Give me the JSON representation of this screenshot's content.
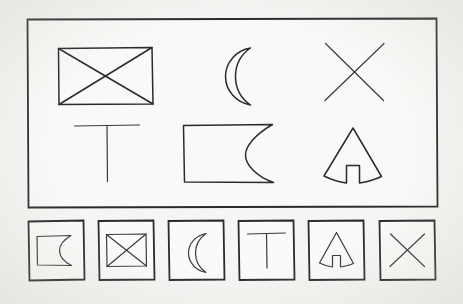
{
  "document": {
    "kind": "hand-drawn-shape-sheet",
    "background_color": "#f6f5f3",
    "ink_color": "#2b2b2b",
    "paper_color": "#faf9f7"
  },
  "main_panel": {
    "name": "main-shape-panel",
    "border_color": "#2b2b2b",
    "rows": [
      {
        "row_index": 1,
        "shapes": [
          {
            "id": "crossed-rectangle",
            "label": "crossed rectangle",
            "icon": "rectangle-with-x-icon"
          },
          {
            "id": "crescent-moon",
            "label": "crescent moon",
            "icon": "crescent-moon-icon"
          },
          {
            "id": "x-cross",
            "label": "x cross",
            "icon": "x-icon"
          }
        ]
      },
      {
        "row_index": 2,
        "shapes": [
          {
            "id": "tee",
            "label": "tee",
            "icon": "t-shape-icon"
          },
          {
            "id": "rectangle-concave-right",
            "label": "rectangle with concave right side",
            "icon": "rectangle-concave-icon"
          },
          {
            "id": "tent",
            "label": "tent with door",
            "icon": "tent-icon"
          }
        ]
      }
    ]
  },
  "thumbnail_strip": {
    "name": "thumbnail-strip",
    "count": 6,
    "boxes": [
      {
        "position": 1,
        "id": "rectangle-concave-right",
        "label": "rectangle with concave right side",
        "icon": "rectangle-concave-icon"
      },
      {
        "position": 2,
        "id": "crossed-rectangle",
        "label": "crossed rectangle",
        "icon": "rectangle-with-x-icon"
      },
      {
        "position": 3,
        "id": "crescent-moon",
        "label": "crescent moon",
        "icon": "crescent-moon-icon"
      },
      {
        "position": 4,
        "id": "tee",
        "label": "tee",
        "icon": "t-shape-icon"
      },
      {
        "position": 5,
        "id": "tent",
        "label": "tent with door",
        "icon": "tent-icon"
      },
      {
        "position": 6,
        "id": "x-cross",
        "label": "x cross",
        "icon": "x-icon"
      }
    ]
  }
}
